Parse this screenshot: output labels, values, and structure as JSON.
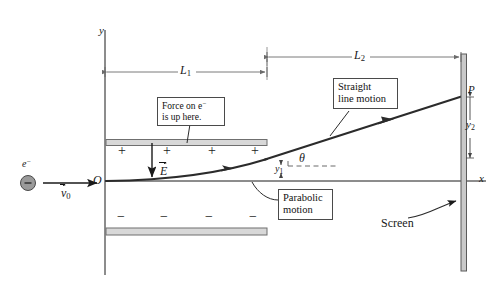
{
  "figure": {
    "axes": {
      "y_label": "y",
      "x_label": "x",
      "origin_label": "O"
    },
    "particle": {
      "symbol": "e",
      "charge_superscript": "−",
      "sign_in_circle": "−",
      "velocity_label": "v",
      "velocity_subscript": "0"
    },
    "field": {
      "label": "E",
      "direction": "down"
    },
    "plates": {
      "top_charges": [
        "+",
        "+",
        "+",
        "+"
      ],
      "bottom_charges": [
        "−",
        "−",
        "−",
        "−"
      ]
    },
    "dimensions": {
      "L1": {
        "label": "L",
        "subscript": "1"
      },
      "L2": {
        "label": "L",
        "subscript": "2"
      },
      "y1": {
        "label": "y",
        "subscript": "1"
      },
      "y2": {
        "label": "y",
        "subscript": "2"
      }
    },
    "angle_label": "θ",
    "point_label": "P",
    "callouts": [
      {
        "id": "force",
        "line1": "Force on e",
        "line1_sup": "−",
        "line2": "is up here."
      },
      {
        "id": "straight",
        "line1": "Straight",
        "line2": "line motion"
      },
      {
        "id": "parabolic",
        "line1": "Parabolic",
        "line2": "motion"
      }
    ],
    "screen_label": "Screen",
    "colors": {
      "ink": "#1a1a1a",
      "trajectory": "#2b2b2b",
      "dimension_line": "#6b6b6b",
      "plate_fill": "#d8d8d8",
      "plate_edge": "#6f6f6f",
      "screen_fill": "#c9c9c9",
      "electron_fill": "#9a9a9a",
      "callout_border": "#4a4a4a",
      "background": "#ffffff"
    }
  }
}
